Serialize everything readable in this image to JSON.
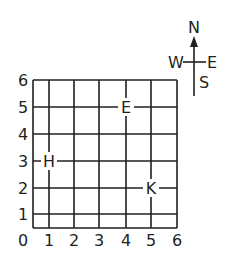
{
  "diagram": {
    "type": "coordinate-grid-map",
    "x_axis": {
      "ticks": [
        "0",
        "1",
        "2",
        "3",
        "4",
        "5",
        "6"
      ]
    },
    "y_axis": {
      "ticks": [
        "0",
        "1",
        "2",
        "3",
        "4",
        "5",
        "6"
      ]
    },
    "points": [
      {
        "label": "E",
        "x": 4,
        "y": 5
      },
      {
        "label": "H",
        "x": 1,
        "y": 3
      },
      {
        "label": "K",
        "x": 5,
        "y": 2
      }
    ],
    "compass": {
      "north": "N",
      "south": "S",
      "east": "E",
      "west": "W"
    },
    "colors": {
      "ink": "#231f20",
      "background": "#ffffff"
    }
  }
}
